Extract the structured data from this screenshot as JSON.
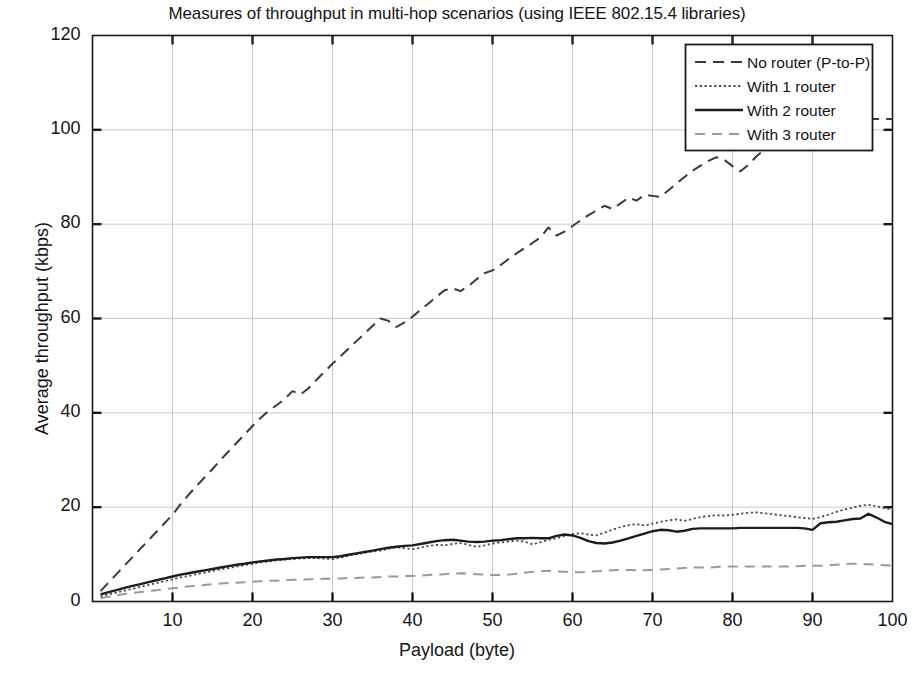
{
  "chart_data": {
    "type": "line",
    "title": "Measures of throughput in multi-hop scenarios (using IEEE 802.15.4 libraries)",
    "xlabel": "Payload (byte)",
    "ylabel": "Average throughput (kbps)",
    "xlim": [
      0,
      100
    ],
    "ylim": [
      0,
      120
    ],
    "xticks": [
      0,
      10,
      20,
      30,
      40,
      50,
      60,
      70,
      80,
      90,
      100
    ],
    "xtick_labels": [
      "",
      "10",
      "20",
      "30",
      "40",
      "50",
      "60",
      "70",
      "80",
      "90",
      "100"
    ],
    "yticks": [
      0,
      20,
      40,
      60,
      80,
      100,
      120
    ],
    "ytick_labels": [
      "0",
      "20",
      "40",
      "60",
      "80",
      "100",
      "120"
    ],
    "grid": true,
    "legend_position": "top-right",
    "x": [
      1,
      2,
      3,
      4,
      5,
      6,
      7,
      8,
      9,
      10,
      11,
      12,
      13,
      14,
      15,
      16,
      17,
      18,
      19,
      20,
      21,
      22,
      23,
      24,
      25,
      26,
      27,
      28,
      29,
      30,
      31,
      32,
      33,
      34,
      35,
      36,
      37,
      38,
      39,
      40,
      41,
      42,
      43,
      44,
      45,
      46,
      47,
      48,
      49,
      50,
      51,
      52,
      53,
      54,
      55,
      56,
      57,
      58,
      59,
      60,
      61,
      62,
      63,
      64,
      65,
      66,
      67,
      68,
      69,
      70,
      71,
      72,
      73,
      74,
      75,
      76,
      77,
      78,
      79,
      80,
      81,
      82,
      83,
      84,
      85,
      86,
      87,
      88,
      89,
      90,
      91,
      92,
      93,
      94,
      95,
      96,
      97,
      98,
      99,
      100
    ],
    "series": [
      {
        "name": "No router (P-to-P)",
        "style": "dashed",
        "color": "#3a3a3a",
        "width": 2.0,
        "dash": "11,7",
        "values": [
          2.2,
          4.0,
          5.8,
          7.6,
          9.4,
          11.2,
          13.0,
          14.8,
          16.6,
          18.4,
          20.6,
          22.6,
          24.5,
          26.3,
          28.1,
          30.0,
          31.8,
          33.6,
          35.4,
          37.2,
          38.9,
          40.4,
          41.6,
          42.9,
          44.6,
          43.9,
          45.2,
          47.0,
          48.7,
          50.4,
          52.0,
          53.6,
          55.2,
          56.8,
          58.4,
          60.0,
          59.5,
          58.2,
          59.2,
          60.4,
          61.8,
          63.2,
          64.6,
          66.0,
          66.4,
          65.8,
          66.9,
          68.3,
          69.6,
          70.2,
          71.3,
          72.6,
          73.8,
          74.9,
          76.0,
          77.2,
          79.3,
          77.6,
          78.4,
          79.6,
          80.8,
          81.9,
          82.9,
          83.9,
          83.2,
          84.4,
          85.6,
          85.0,
          86.2,
          86.0,
          85.8,
          87.2,
          88.6,
          90.0,
          91.3,
          92.4,
          93.4,
          94.2,
          93.6,
          92.3,
          91.2,
          92.6,
          94.4,
          95.8,
          97.0,
          98.0,
          98.9,
          99.7,
          100.4,
          101.0,
          101.4,
          101.7,
          101.9,
          102.0,
          102.1,
          102.2,
          102.3,
          102.3,
          102.3,
          102.3
        ]
      },
      {
        "name": "With 1 router",
        "style": "dotted",
        "color": "#4a4a4a",
        "width": 1.8,
        "dash": "2.2,2.6",
        "values": [
          1.1,
          1.5,
          1.9,
          2.3,
          2.7,
          3.1,
          3.5,
          3.9,
          4.3,
          4.7,
          5.1,
          5.4,
          5.8,
          6.1,
          6.5,
          6.8,
          7.1,
          7.4,
          7.7,
          8.0,
          8.3,
          8.5,
          8.7,
          8.9,
          9.0,
          9.1,
          9.2,
          9.2,
          9.1,
          9.0,
          9.3,
          9.7,
          10.0,
          10.3,
          10.6,
          10.8,
          11.2,
          11.5,
          11.3,
          11.1,
          11.4,
          11.8,
          12.0,
          11.9,
          12.2,
          12.4,
          12.0,
          11.6,
          11.9,
          12.3,
          12.5,
          12.7,
          12.9,
          12.7,
          12.1,
          12.6,
          13.1,
          13.4,
          13.9,
          14.3,
          14.5,
          14.2,
          14.0,
          14.6,
          15.2,
          15.8,
          16.2,
          16.4,
          16.1,
          16.5,
          16.9,
          17.2,
          17.4,
          17.1,
          17.5,
          17.9,
          18.1,
          18.3,
          18.2,
          18.4,
          18.6,
          18.8,
          18.9,
          18.7,
          18.5,
          18.3,
          18.1,
          17.9,
          17.7,
          17.5,
          17.9,
          18.4,
          19.0,
          19.5,
          19.9,
          20.3,
          20.5,
          20.2,
          19.8,
          19.5
        ]
      },
      {
        "name": "With 2 router",
        "style": "solid",
        "color": "#1c1c1c",
        "width": 2.4,
        "dash": "",
        "values": [
          1.5,
          2.0,
          2.4,
          2.9,
          3.3,
          3.7,
          4.1,
          4.5,
          4.9,
          5.3,
          5.7,
          6.0,
          6.3,
          6.6,
          6.9,
          7.2,
          7.5,
          7.8,
          8.0,
          8.3,
          8.5,
          8.7,
          8.9,
          9.0,
          9.2,
          9.3,
          9.4,
          9.4,
          9.4,
          9.4,
          9.6,
          9.9,
          10.2,
          10.5,
          10.8,
          11.1,
          11.4,
          11.6,
          11.8,
          11.9,
          12.2,
          12.5,
          12.8,
          13.0,
          13.1,
          12.9,
          12.7,
          12.6,
          12.7,
          12.9,
          13.0,
          13.2,
          13.4,
          13.4,
          13.5,
          13.4,
          13.4,
          13.9,
          14.2,
          14.0,
          13.5,
          12.8,
          12.4,
          12.3,
          12.5,
          12.9,
          13.4,
          13.9,
          14.4,
          14.9,
          15.2,
          15.1,
          14.8,
          15.0,
          15.4,
          15.5,
          15.5,
          15.5,
          15.5,
          15.5,
          15.6,
          15.6,
          15.6,
          15.6,
          15.6,
          15.6,
          15.6,
          15.6,
          15.5,
          15.2,
          16.6,
          16.8,
          16.9,
          17.2,
          17.5,
          17.6,
          18.6,
          17.8,
          16.9,
          16.4
        ]
      },
      {
        "name": "With 3 router",
        "style": "dashed-light",
        "color": "#9a9a9a",
        "width": 2.0,
        "dash": "10,7",
        "values": [
          0.7,
          1.0,
          1.3,
          1.6,
          1.8,
          2.0,
          2.2,
          2.4,
          2.6,
          2.8,
          3.0,
          3.2,
          3.4,
          3.5,
          3.7,
          3.8,
          3.9,
          4.0,
          4.1,
          4.2,
          4.3,
          4.4,
          4.4,
          4.5,
          4.6,
          4.6,
          4.7,
          4.7,
          4.8,
          4.8,
          4.9,
          5.0,
          5.0,
          5.1,
          5.1,
          5.2,
          5.3,
          5.3,
          5.4,
          5.4,
          5.5,
          5.6,
          5.7,
          5.8,
          5.9,
          6.0,
          5.9,
          5.8,
          5.7,
          5.6,
          5.6,
          5.7,
          5.9,
          6.1,
          6.3,
          6.4,
          6.5,
          6.4,
          6.3,
          6.2,
          6.2,
          6.3,
          6.4,
          6.5,
          6.6,
          6.7,
          6.7,
          6.6,
          6.6,
          6.7,
          6.8,
          6.9,
          7.0,
          7.1,
          7.2,
          7.2,
          7.2,
          7.3,
          7.4,
          7.4,
          7.4,
          7.4,
          7.4,
          7.4,
          7.4,
          7.4,
          7.4,
          7.5,
          7.6,
          7.6,
          7.6,
          7.7,
          7.8,
          7.9,
          8.0,
          8.0,
          7.9,
          7.8,
          7.7,
          7.6
        ]
      }
    ]
  },
  "legend": {
    "entries": [
      {
        "label": "No router (P-to-P)"
      },
      {
        "label": "With 1 router"
      },
      {
        "label": "With 2 router"
      },
      {
        "label": "With 3 router"
      }
    ]
  }
}
